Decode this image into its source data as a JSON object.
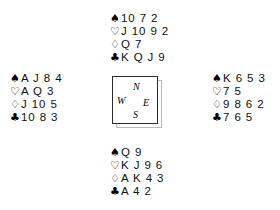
{
  "diagram": {
    "type": "bridge-hand-deal",
    "suit_symbols": {
      "spade": "♠",
      "heart": "♡",
      "diamond": "♢",
      "club": "♣"
    },
    "compass": {
      "north": "N",
      "west": "W",
      "east": "E",
      "south": "S"
    },
    "hands": {
      "north": {
        "position": "North",
        "spades": "10 7 2",
        "hearts": "J 10 9 2",
        "diamonds": "Q 7",
        "clubs": "K Q J 9"
      },
      "west": {
        "position": "West",
        "spades": "A J 8 4",
        "hearts": "A Q 3",
        "diamonds": "J 10 5",
        "clubs": "10 8 3"
      },
      "east": {
        "position": "East",
        "spades": "K 6 5 3",
        "hearts": "7 5",
        "diamonds": "9 8 6 2",
        "clubs": "7 6 5"
      },
      "south": {
        "position": "South",
        "spades": "Q 9",
        "hearts": "K J 9 6",
        "diamonds": "A K 4 3",
        "clubs": "A 4 2"
      }
    }
  },
  "colors": {
    "ink": "#101010",
    "background": "#ffffff",
    "box_border": "#2b2b2b",
    "box_shadow": "#b9b9b9"
  }
}
